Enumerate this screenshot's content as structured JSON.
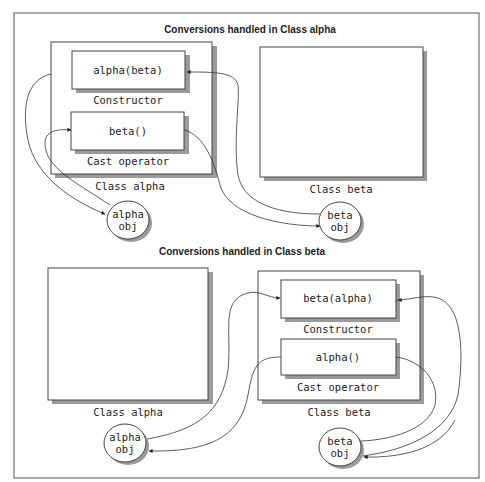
{
  "diagram": {
    "top_section": {
      "title": "Conversions handled in Class alpha",
      "class_alpha": {
        "label": "Class alpha",
        "constructor": {
          "code": "alpha(beta)",
          "caption": "Constructor"
        },
        "cast_operator": {
          "code": "beta()",
          "caption": "Cast operator"
        }
      },
      "class_beta": {
        "label": "Class beta"
      },
      "alpha_obj": {
        "line1": "alpha",
        "line2": "obj"
      },
      "beta_obj": {
        "line1": "beta",
        "line2": "obj"
      }
    },
    "bottom_section": {
      "title": "Conversions handled in Class beta",
      "class_alpha": {
        "label": "Class alpha"
      },
      "class_beta": {
        "label": "Class beta",
        "constructor": {
          "code": "beta(alpha)",
          "caption": "Constructor"
        },
        "cast_operator": {
          "code": "alpha()",
          "caption": "Cast operator"
        }
      },
      "alpha_obj": {
        "line1": "alpha",
        "line2": "obj"
      },
      "beta_obj": {
        "line1": "beta",
        "line2": "obj"
      }
    }
  }
}
